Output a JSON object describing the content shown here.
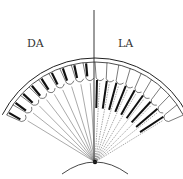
{
  "diagram": {
    "labels": {
      "left": "DA",
      "right": "LA"
    },
    "geometry": {
      "center_x": 95,
      "center_y": 162,
      "outer_radius": 104,
      "outer_radius_inner": 100,
      "cell_inner_radius": 80,
      "left_angle_start_deg": -62,
      "right_angle_end_deg": 62,
      "units_per_side": 9
    },
    "sides": [
      {
        "name": "dark-adapted",
        "label": "DA",
        "pigment": "distal",
        "rays": "solid"
      },
      {
        "name": "light-adapted",
        "label": "LA",
        "pigment": "proximal",
        "rays": "dashed"
      }
    ],
    "colors": {
      "stroke": "#222222",
      "pigment": "#111111",
      "ray": "#555555",
      "background": "#ffffff"
    }
  }
}
